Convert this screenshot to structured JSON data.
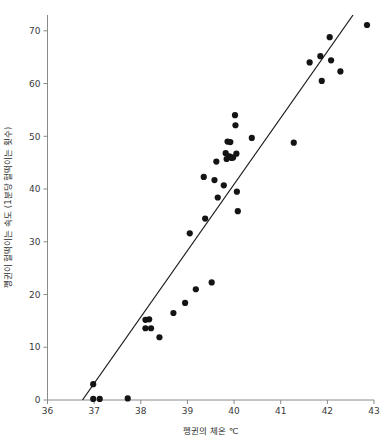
{
  "chart_data": {
    "type": "scatter",
    "title": "",
    "xlabel": "펭귄의 체온 ℃",
    "ylabel": "펭귄이 헐떡이는 속도 (1분당 헐떡이는 횟수)",
    "xlim": [
      36,
      43
    ],
    "ylim": [
      0,
      73
    ],
    "xticks": [
      36,
      37,
      38,
      39,
      40,
      41,
      42,
      43
    ],
    "yticks": [
      0,
      10,
      20,
      30,
      40,
      50,
      60,
      70
    ],
    "xtick_labels": [
      "36",
      "37",
      "38",
      "39",
      "40",
      "41",
      "42",
      "43"
    ],
    "ytick_labels": [
      "0",
      "10",
      "20",
      "30",
      "40",
      "50",
      "60",
      "70"
    ],
    "grid": false,
    "legend": null,
    "point_color": "#141414",
    "line_color": "#1a1a1a",
    "axis_color": "#8a8a8a",
    "points": [
      [
        36.98,
        3.0
      ],
      [
        36.98,
        0.2
      ],
      [
        37.12,
        0.2
      ],
      [
        37.72,
        0.3
      ],
      [
        38.1,
        15.2
      ],
      [
        38.1,
        13.6
      ],
      [
        38.18,
        15.3
      ],
      [
        38.22,
        13.6
      ],
      [
        38.4,
        11.9
      ],
      [
        38.7,
        16.5
      ],
      [
        38.95,
        18.4
      ],
      [
        39.05,
        31.6
      ],
      [
        39.18,
        21.0
      ],
      [
        39.35,
        42.3
      ],
      [
        39.38,
        34.4
      ],
      [
        39.52,
        22.3
      ],
      [
        39.58,
        41.7
      ],
      [
        39.62,
        45.2
      ],
      [
        39.65,
        38.4
      ],
      [
        39.78,
        40.7
      ],
      [
        39.82,
        46.8
      ],
      [
        39.84,
        45.7
      ],
      [
        39.86,
        49.0
      ],
      [
        39.9,
        46.2
      ],
      [
        39.92,
        48.9
      ],
      [
        39.95,
        45.9
      ],
      [
        39.98,
        46.0
      ],
      [
        40.02,
        54.0
      ],
      [
        40.03,
        52.1
      ],
      [
        40.05,
        46.7
      ],
      [
        40.06,
        39.5
      ],
      [
        40.08,
        35.8
      ],
      [
        40.38,
        49.7
      ],
      [
        41.28,
        48.8
      ],
      [
        41.62,
        64.0
      ],
      [
        41.85,
        65.2
      ],
      [
        41.88,
        60.5
      ],
      [
        42.05,
        68.8
      ],
      [
        42.08,
        64.4
      ],
      [
        42.28,
        62.3
      ],
      [
        42.85,
        71.1
      ]
    ],
    "fit_line": {
      "x_start": 36.75,
      "y_start": 0,
      "x_end": 42.55,
      "y_end": 73.0
    }
  }
}
